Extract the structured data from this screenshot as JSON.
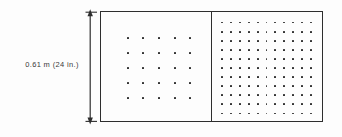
{
  "figure": {
    "type": "engineering-detail-drawing",
    "background_color": "#fdfdfd",
    "line_color": "#2e2e2e",
    "dot_color": "#232323"
  },
  "dimension": {
    "label": "0.61 m (24 in.)",
    "value_metric": "0.61 m",
    "value_imperial": "24 in.",
    "orientation": "vertical",
    "applies_to": "overall-height",
    "arrowhead_top": "up-arrow-icon",
    "arrowhead_bottom": "down-arrow-icon",
    "extension_tick_top": "extension-tick-icon",
    "extension_tick_bottom": "extension-tick-icon"
  },
  "assembly": {
    "panels": [
      {
        "name": "left-panel",
        "pattern": "sparse",
        "grid_columns": 5,
        "grid_rows": 5,
        "dot_count": 25
      },
      {
        "name": "right-panel",
        "pattern": "dense",
        "grid_columns": 11,
        "grid_rows": 11,
        "dot_count": 121
      }
    ],
    "divider": "vertical-divider-line"
  },
  "chart_data": {
    "type": "scatter",
    "title": "",
    "xlabel": "",
    "ylabel": "0.61 m (24 in.)",
    "grid": false,
    "legend": "none",
    "series": [
      {
        "name": "left-panel-sparse-grid",
        "columns": 5,
        "rows": 5,
        "points": 25
      },
      {
        "name": "right-panel-dense-grid",
        "columns": 11,
        "rows": 11,
        "points": 121
      }
    ]
  }
}
